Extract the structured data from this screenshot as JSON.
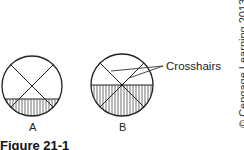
{
  "figure": {
    "caption": "Figure 21-1",
    "copyright": "© Cengage Learning 2013",
    "callout_label": "Crosshairs",
    "panels": [
      {
        "label": "A",
        "description": "Circle with crosshairs; liquid level shaded below lower chord"
      },
      {
        "label": "B",
        "description": "Circle with crosshairs; liquid level shaded at crosshair intersection"
      }
    ]
  }
}
